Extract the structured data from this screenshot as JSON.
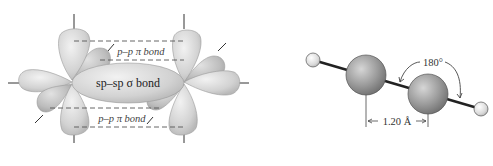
{
  "orbital_diagram": {
    "sigma_label": "sp–sp σ bond",
    "pi_label_top": "p–p π bond",
    "pi_label_bottom": "p–p π bond",
    "colors": {
      "lobe": "#d4d4d4",
      "lobe_dark": "#b4b4b4",
      "dash": "#555555",
      "text": "#333333"
    }
  },
  "molecule_model": {
    "angle_label": "180°",
    "bond_length_label": "1.20 Å",
    "atoms": [
      {
        "element": "H",
        "role": "hydrogen-left"
      },
      {
        "element": "C",
        "role": "carbon-left"
      },
      {
        "element": "C",
        "role": "carbon-right"
      },
      {
        "element": "H",
        "role": "hydrogen-right"
      }
    ],
    "colors": {
      "carbon": "#8f8f8f",
      "hydrogen": "#dcdcdc",
      "bond": "#222222"
    }
  }
}
